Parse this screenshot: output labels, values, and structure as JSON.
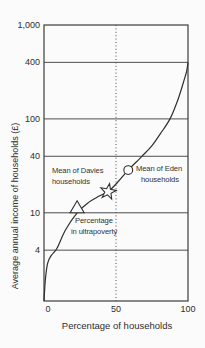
{
  "figure": {
    "background": "#fbfbfb",
    "ink_color": "#2f2f2f",
    "marker_fill": "#fcfcfc"
  },
  "chart_data": {
    "type": "line",
    "title": "",
    "xlabel": "Percentage of households",
    "ylabel": "Average annual income of households (£)",
    "x_scale": "linear",
    "y_scale": "log",
    "xlim": [
      0,
      100
    ],
    "ylim": [
      1.15,
      1000
    ],
    "grid": "horizontal gridlines at labeled y-ticks",
    "legend": "none",
    "x_ticks": [
      {
        "value": 0,
        "label": "0"
      },
      {
        "value": 50,
        "label": "50"
      },
      {
        "value": 100,
        "label": "100"
      }
    ],
    "y_ticks": [
      {
        "value": 1000,
        "label": "1,000"
      },
      {
        "value": 400,
        "label": "400"
      },
      {
        "value": 100,
        "label": "100"
      },
      {
        "value": 40,
        "label": "40"
      },
      {
        "value": 10,
        "label": "10"
      },
      {
        "value": 4,
        "label": "4"
      }
    ],
    "y_gridlines": [
      400,
      100,
      40,
      10,
      4
    ],
    "reference_line": {
      "axis": "x",
      "value": 50,
      "style": "dotted"
    },
    "series": [
      {
        "name": "Average annual income by cumulative percentage of households",
        "points": [
          [
            0,
            1.15
          ],
          [
            1,
            1.95
          ],
          [
            2.5,
            2.9
          ],
          [
            5,
            3.5
          ],
          [
            9,
            4.2
          ],
          [
            15,
            6.6
          ],
          [
            23,
            10
          ],
          [
            31,
            12.9
          ],
          [
            38,
            15
          ],
          [
            44.5,
            16.8
          ],
          [
            51,
            21
          ],
          [
            58.5,
            28.5
          ],
          [
            68,
            40
          ],
          [
            75,
            52
          ],
          [
            81,
            70
          ],
          [
            87.5,
            100
          ],
          [
            93,
            160
          ],
          [
            97,
            250
          ],
          [
            99,
            320
          ],
          [
            100,
            400
          ]
        ]
      }
    ],
    "annotations": [
      {
        "marker": "star",
        "x": 44.5,
        "y": 16.8,
        "label": "Mean of Davies households",
        "label_lines": [
          "Mean of Davies",
          "households"
        ]
      },
      {
        "marker": "circle",
        "x": 58.5,
        "y": 28.5,
        "label": "Mean of Eden households",
        "label_lines": [
          "Mean of Eden",
          "households"
        ]
      },
      {
        "marker": "triangle",
        "x": 23,
        "y": 10,
        "label": "Percentage in ultrapoverty",
        "label_lines": [
          "Percentage",
          "in ultrapoverty"
        ]
      }
    ]
  }
}
